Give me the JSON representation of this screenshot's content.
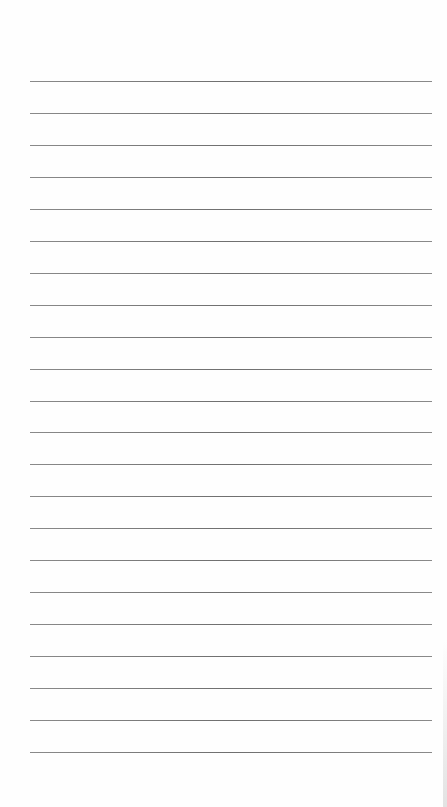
{
  "document": {
    "type": "lined-paper",
    "background_color": "#ffffff",
    "rule_color": "#7a7a7a",
    "rule_count": 22,
    "first_rule_y": 81,
    "rule_spacing": 31.95,
    "rule_left": 30,
    "rule_right": 432,
    "text": []
  }
}
